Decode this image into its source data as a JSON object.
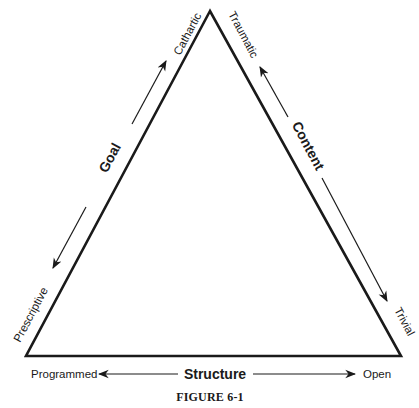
{
  "figure": {
    "caption": "FIGURE 6-1",
    "vertices": {
      "top": [
        210,
        11
      ],
      "bottom_left": [
        26,
        356
      ],
      "bottom_right": [
        401,
        356
      ]
    },
    "colors": {
      "line": "#1a1a1a",
      "background": "#ffffff"
    }
  },
  "dimensions": {
    "goal": {
      "label": "Goal",
      "pole_start": "Prescriptive",
      "pole_end": "Cathartic",
      "side": "left"
    },
    "content": {
      "label": "Content",
      "pole_start": "Traumatic",
      "pole_end": "Trivial",
      "side": "right"
    },
    "structure": {
      "label": "Structure",
      "pole_start": "Programmed",
      "pole_end": "Open",
      "side": "bottom"
    }
  }
}
